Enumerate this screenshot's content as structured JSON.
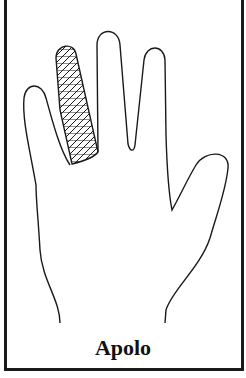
{
  "figure": {
    "caption": "Apolo",
    "highlighted_finger": "ring finger",
    "colors": {
      "line": "#1a1a1a",
      "background": "#ffffff",
      "hatch": "#1a1a1a"
    }
  }
}
